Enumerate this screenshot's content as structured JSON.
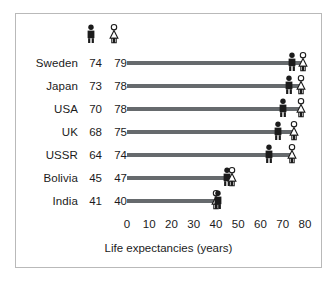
{
  "chart_data": {
    "type": "bar",
    "title": "",
    "xlabel": "Life expectancies (years)",
    "ylabel": "",
    "xlim": [
      0,
      80
    ],
    "xticks": [
      0,
      10,
      20,
      30,
      40,
      50,
      60,
      70,
      80
    ],
    "xtick_labels": [
      "0",
      "10",
      "20",
      "30",
      "40",
      "50",
      "60",
      "70",
      "80"
    ],
    "grid": false,
    "legend_position": "top",
    "series": [
      {
        "name": "male",
        "icon": "male-figure-icon",
        "style": "filled",
        "color": "#1b1b1b",
        "values": [
          74,
          73,
          70,
          68,
          64,
          45,
          41
        ]
      },
      {
        "name": "female",
        "icon": "female-figure-icon",
        "style": "outline",
        "color": "#ffffff",
        "values": [
          79,
          78,
          78,
          75,
          74,
          47,
          40
        ]
      }
    ],
    "categories": [
      "Sweden",
      "Japan",
      "USA",
      "UK",
      "USSR",
      "Bolivia",
      "India"
    ],
    "rows": [
      {
        "label": "Sweden",
        "male": 74,
        "female": 79,
        "male_text": "74",
        "female_text": "79"
      },
      {
        "label": "Japan",
        "male": 73,
        "female": 78,
        "male_text": "73",
        "female_text": "78"
      },
      {
        "label": "USA",
        "male": 70,
        "female": 78,
        "male_text": "70",
        "female_text": "78"
      },
      {
        "label": "UK",
        "male": 68,
        "female": 75,
        "male_text": "68",
        "female_text": "75"
      },
      {
        "label": "USSR",
        "male": 64,
        "female": 74,
        "male_text": "64",
        "female_text": "74"
      },
      {
        "label": "Bolivia",
        "male": 45,
        "female": 47,
        "male_text": "45",
        "female_text": "47"
      },
      {
        "label": "India",
        "male": 41,
        "female": 40,
        "male_text": "41",
        "female_text": "40"
      }
    ],
    "line_color": "#666a6d",
    "text_color": "#1b1b1b",
    "border_color": "#b9b9b9",
    "background": "#ffffff"
  },
  "caption": {
    "text": "Life expectancies (years)"
  },
  "legend": {
    "male_label": "male-figure-icon",
    "female_label": "female-figure-icon"
  }
}
